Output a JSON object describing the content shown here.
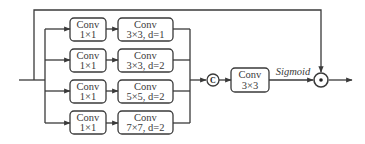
{
  "diagram": {
    "type": "multi-scale dilated convolution attention block",
    "colors": {
      "stroke": "#3a3a3a",
      "text": "#3a3a3a",
      "background": "#ffffff"
    },
    "branches": [
      {
        "first": {
          "line1": "Conv",
          "line2": "1×1"
        },
        "second": {
          "line1": "Conv",
          "line2": "3×3, d=1"
        }
      },
      {
        "first": {
          "line1": "Conv",
          "line2": "1×1"
        },
        "second": {
          "line1": "Conv",
          "line2": "3×3, d=2"
        }
      },
      {
        "first": {
          "line1": "Conv",
          "line2": "1×1"
        },
        "second": {
          "line1": "Conv",
          "line2": "5×5, d=2"
        }
      },
      {
        "first": {
          "line1": "Conv",
          "line2": "1×1"
        },
        "second": {
          "line1": "Conv",
          "line2": "7×7, d=2"
        }
      }
    ],
    "concat": {
      "symbol": "C"
    },
    "fuse_conv": {
      "line1": "Conv",
      "line2": "3×3"
    },
    "activation_label": "Sigmoid",
    "multiply": {
      "symbol": "⊙"
    }
  }
}
